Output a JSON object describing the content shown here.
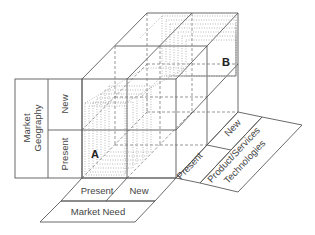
{
  "diagram": {
    "type": "3d-cube-matrix",
    "corner_labels": {
      "a": "A",
      "b": "B"
    },
    "axes": {
      "market_geography": {
        "title": "Market Geography",
        "title_line1": "Market",
        "title_line2": "Geography",
        "levels": [
          "Present",
          "New"
        ]
      },
      "market_need": {
        "title": "Market Need",
        "levels": [
          "Present",
          "New"
        ]
      },
      "product_technologies": {
        "title": "Product/Services Technologies",
        "title_line1": "Product/Services",
        "title_line2": "Technologies",
        "levels": [
          "Present",
          "New"
        ]
      }
    },
    "colors": {
      "line": "#5a5a5a",
      "text": "#444444",
      "background": "#ffffff"
    }
  }
}
